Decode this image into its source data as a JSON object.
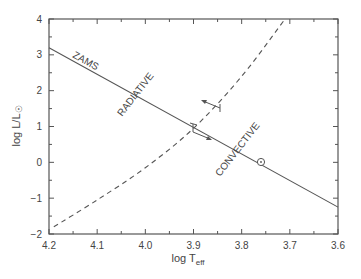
{
  "chart_data": {
    "type": "line",
    "title": "",
    "xlabel": "log T_eff",
    "xlabel_main": "log T",
    "xlabel_sub": "eff",
    "ylabel": "log L/L☉",
    "ylabel_main": "log L/L",
    "ylabel_sub": "☉",
    "xlim": [
      4.2,
      3.6
    ],
    "ylim": [
      -2,
      4
    ],
    "x_inverted": true,
    "grid": false,
    "xticks": [
      "4.2",
      "4.1",
      "4.0",
      "3.9",
      "3.8",
      "3.7",
      "3.6"
    ],
    "yticks": [
      "-2",
      "-1",
      "0",
      "1",
      "2",
      "3",
      "4"
    ],
    "series": [
      {
        "name": "ZAMS",
        "style": "solid",
        "x": [
          4.2,
          3.6
        ],
        "y": [
          3.2,
          -1.25
        ]
      },
      {
        "name": "radiative/convective boundary",
        "style": "dashed",
        "x": [
          4.19,
          4.1,
          4.0,
          3.9,
          3.8,
          3.71
        ],
        "y": [
          -1.8,
          -1.05,
          -0.15,
          0.95,
          2.4,
          4.0
        ]
      }
    ],
    "markers": [
      {
        "name": "Sun",
        "symbol": "☉",
        "x": 3.76,
        "y": 0.0
      }
    ],
    "annotations": [
      "ZAMS",
      "RADIATIVE",
      "CONVECTIVE"
    ]
  },
  "labels": {
    "zams": "ZAMS",
    "radiative": "RADIATIVE",
    "convective": "CONVECTIVE"
  },
  "colors": {
    "line": "#555555",
    "text": "#444444",
    "axis": "#555555"
  }
}
